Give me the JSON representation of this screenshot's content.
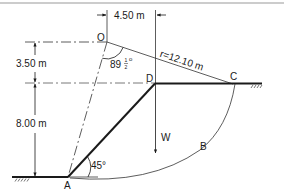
{
  "diagram": {
    "type": "slope-stability-slip-circle",
    "points": {
      "O": "O",
      "A": "A",
      "B": "B",
      "C": "C",
      "D": "D"
    },
    "dimensions": {
      "horizontal_offset": "4.50 m",
      "upper_height": "3.50 m",
      "slope_height": "8.00 m",
      "radius": "r=12.10 m"
    },
    "angles": {
      "center_angle_whole": "89",
      "center_angle_num": "1",
      "center_angle_den": "2",
      "center_angle_deg": "o",
      "slope_angle": "45°"
    },
    "force": {
      "weight": "W"
    },
    "colors": {
      "line": "#1a1a1a",
      "thin": "#555555",
      "border": "#999999"
    }
  }
}
